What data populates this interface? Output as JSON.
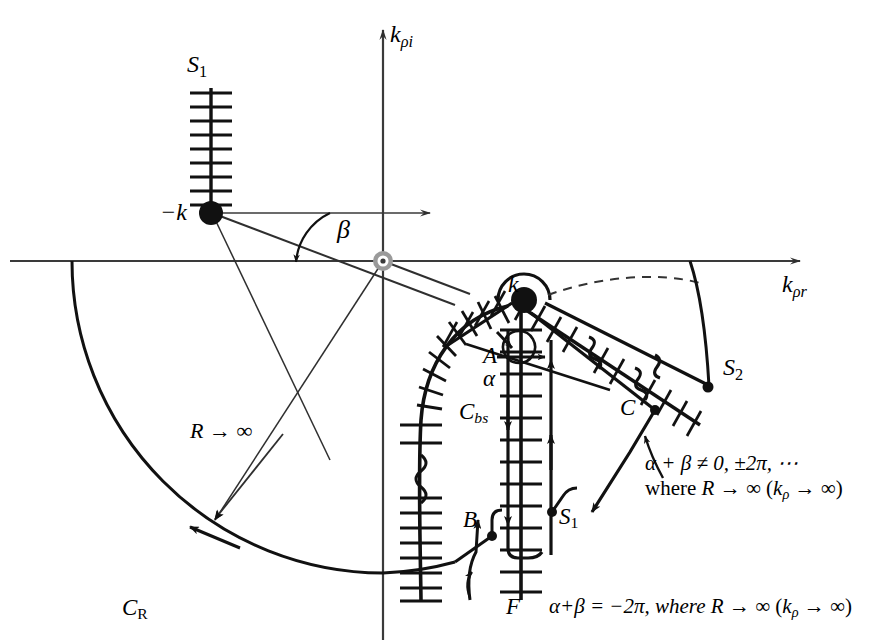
{
  "figure": {
    "type": "complex-plane-contour-diagram"
  },
  "axes": {
    "imaginary_label": "k",
    "imaginary_sub": "ρi",
    "real_label": "k",
    "real_sub": "ρr"
  },
  "poles": {
    "left": {
      "label": "−k"
    },
    "right": {
      "label": "k"
    },
    "origin": {
      "label": ""
    }
  },
  "labels": {
    "s1_top": {
      "base": "S",
      "sub": "1"
    },
    "s1_bottom": {
      "base": "S",
      "sub": "1"
    },
    "s2": {
      "base": "S",
      "sub": "2"
    },
    "cbs": {
      "base": "C",
      "sub": "bs"
    },
    "cr": {
      "base": "C",
      "sub": "R"
    },
    "point_a": "A",
    "point_b": "B",
    "point_c": "C",
    "point_f": "F",
    "alpha": "α",
    "beta": "β",
    "radius": "R → ∞"
  },
  "annotations": {
    "right": {
      "line1": "α + β ≠ 0, ±2π, ⋯",
      "line2_pre": "where ",
      "line2_R": "R",
      "line2_mid": " → ∞ (",
      "line2_k": "k",
      "line2_ksub": "ρ",
      "line2_post": " → ∞)"
    },
    "bottom": {
      "line1_pre": "α+β = −2π, where ",
      "line1_R": "R",
      "line1_mid": " → ∞ (",
      "line1_k": "k",
      "line1_ksub": "ρ",
      "line1_post": " → ∞)"
    }
  },
  "colors": {
    "ink": "#111111",
    "axis": "#3a3a3a",
    "origin_marker": "#9a9a9a",
    "background": "#ffffff"
  }
}
